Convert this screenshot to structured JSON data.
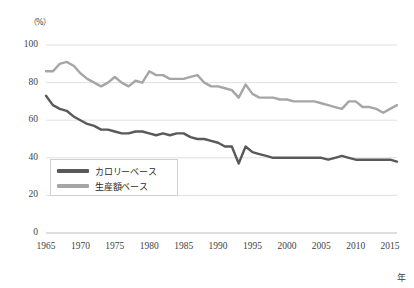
{
  "chart_data": {
    "type": "line",
    "title": "",
    "xlabel": "年",
    "ylabel": "（%）",
    "xlim": [
      1965,
      2016
    ],
    "ylim": [
      0,
      100
    ],
    "grid": true,
    "legend_position": "inside-left",
    "x_ticks": [
      "1965",
      "1970",
      "1975",
      "1980",
      "1985",
      "1990",
      "1995",
      "2000",
      "2005",
      "2010",
      "2015"
    ],
    "y_ticks": [
      "0",
      "20",
      "40",
      "60",
      "80",
      "100"
    ],
    "x": [
      1965,
      1966,
      1967,
      1968,
      1969,
      1970,
      1971,
      1972,
      1973,
      1974,
      1975,
      1976,
      1977,
      1978,
      1979,
      1980,
      1981,
      1982,
      1983,
      1984,
      1985,
      1986,
      1987,
      1988,
      1989,
      1990,
      1991,
      1992,
      1993,
      1994,
      1995,
      1996,
      1997,
      1998,
      1999,
      2000,
      2001,
      2002,
      2003,
      2004,
      2005,
      2006,
      2007,
      2008,
      2009,
      2010,
      2011,
      2012,
      2013,
      2014,
      2015,
      2016
    ],
    "series": [
      {
        "name": "カロリーベース",
        "color": "#595959",
        "values": [
          73,
          68,
          66,
          65,
          62,
          60,
          58,
          57,
          55,
          55,
          54,
          53,
          53,
          54,
          54,
          53,
          52,
          53,
          52,
          53,
          53,
          51,
          50,
          50,
          49,
          48,
          46,
          46,
          37,
          46,
          43,
          42,
          41,
          40,
          40,
          40,
          40,
          40,
          40,
          40,
          40,
          39,
          40,
          41,
          40,
          39,
          39,
          39,
          39,
          39,
          39,
          38
        ]
      },
      {
        "name": "生産額ベース",
        "color": "#a6a6a6",
        "values": [
          86,
          86,
          90,
          91,
          89,
          85,
          82,
          80,
          78,
          80,
          83,
          80,
          78,
          81,
          80,
          86,
          84,
          84,
          82,
          82,
          82,
          83,
          84,
          80,
          78,
          78,
          77,
          76,
          72,
          79,
          74,
          72,
          72,
          72,
          71,
          71,
          70,
          70,
          70,
          70,
          69,
          68,
          67,
          66,
          70,
          70,
          67,
          67,
          66,
          64,
          66,
          68
        ]
      }
    ]
  },
  "axis": {
    "y_unit_label": "（%）",
    "x_unit_label": "年"
  },
  "legend": {
    "items": [
      {
        "label": "カロリーベース",
        "color": "#595959"
      },
      {
        "label": "生産額ベース",
        "color": "#a6a6a6"
      }
    ]
  }
}
